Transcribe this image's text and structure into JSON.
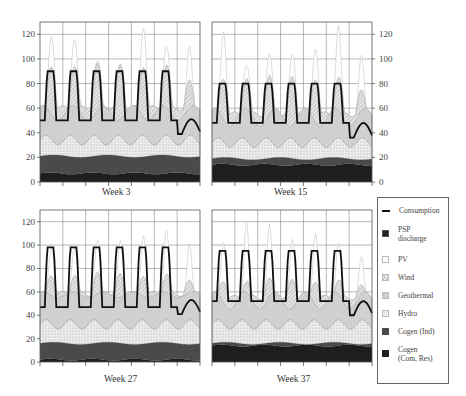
{
  "chart_data": [
    {
      "type": "area",
      "title": "Week 3",
      "xlabel": "Week 3",
      "ylabel": "",
      "ylim": [
        0,
        130
      ],
      "yticks": [
        0,
        20,
        40,
        60,
        80,
        100,
        120
      ],
      "y_axis_side": "left",
      "x_ticks_count": 8,
      "grid": true,
      "series": [
        {
          "name": "Cogen (Com, Res)",
          "approx_level": 7
        },
        {
          "name": "Cogen (Ind)",
          "approx_level": 21
        },
        {
          "name": "Hydro",
          "approx_range": [
            30,
            38
          ]
        },
        {
          "name": "Geothermal",
          "approx_range": [
            50,
            62
          ]
        },
        {
          "name": "Wind",
          "approx_range": [
            60,
            95
          ]
        },
        {
          "name": "PV",
          "approx_peaks": [
            118,
            116,
            98,
            92,
            125,
            110
          ]
        },
        {
          "name": "Consumption",
          "daily_peak": 90,
          "night_min": 50,
          "weekend_min": 39
        }
      ]
    },
    {
      "type": "area",
      "title": "Week 15",
      "xlabel": "Week 15",
      "ylim": [
        0,
        130
      ],
      "yticks": [
        0,
        20,
        40,
        60,
        80,
        100,
        120
      ],
      "y_axis_side": "right",
      "x_ticks_count": 8,
      "grid": true,
      "series": [
        {
          "name": "Cogen (Com, Res)",
          "approx_level": 14
        },
        {
          "name": "Cogen (Ind)",
          "approx_level": 19
        },
        {
          "name": "Hydro",
          "approx_range": [
            28,
            36
          ]
        },
        {
          "name": "Geothermal",
          "approx_range": [
            45,
            60
          ]
        },
        {
          "name": "Wind",
          "approx_range": [
            55,
            85
          ]
        },
        {
          "name": "PV",
          "approx_peaks": [
            122,
            95,
            104,
            104,
            108,
            127,
            103
          ]
        },
        {
          "name": "Consumption",
          "daily_peak": 80,
          "night_min": 48,
          "weekend_min": 36
        }
      ]
    },
    {
      "type": "area",
      "title": "Week 27",
      "xlabel": "Week 27",
      "ylim": [
        0,
        130
      ],
      "yticks": [
        0,
        20,
        40,
        60,
        80,
        100,
        120
      ],
      "y_axis_side": "left",
      "x_ticks_count": 8,
      "grid": true,
      "series": [
        {
          "name": "Cogen (Com, Res)",
          "approx_level": 2
        },
        {
          "name": "Cogen (Ind)",
          "approx_level": 16
        },
        {
          "name": "Hydro",
          "approx_range": [
            28,
            36
          ]
        },
        {
          "name": "Geothermal",
          "approx_range": [
            55,
            60
          ]
        },
        {
          "name": "Wind",
          "approx_range": [
            58,
            75
          ]
        },
        {
          "name": "PV",
          "approx_peaks": [
            98,
            98,
            104,
            104,
            108,
            113,
            101
          ]
        },
        {
          "name": "Consumption",
          "daily_peak": 98,
          "night_min": 47,
          "weekend_min": 41
        }
      ]
    },
    {
      "type": "area",
      "title": "Week 37",
      "xlabel": "Week 37",
      "ylim": [
        0,
        130
      ],
      "yticks": [
        0,
        20,
        40,
        60,
        80,
        100,
        120
      ],
      "y_axis_side": "none",
      "x_ticks_count": 8,
      "grid": true,
      "series": [
        {
          "name": "Cogen (Com, Res)",
          "approx_level": 14
        },
        {
          "name": "Cogen (Ind)",
          "approx_level": 16
        },
        {
          "name": "Hydro",
          "approx_range": [
            28,
            36
          ]
        },
        {
          "name": "Geothermal",
          "approx_range": [
            45,
            60
          ]
        },
        {
          "name": "Wind",
          "approx_range": [
            55,
            70
          ]
        },
        {
          "name": "PV",
          "approx_peaks": [
            102,
            120,
            118,
            105,
            110,
            102,
            90
          ]
        },
        {
          "name": "Consumption",
          "daily_peak": 95,
          "night_min": 52,
          "weekend_min": 40
        }
      ]
    }
  ],
  "panels": {
    "tl": {
      "label": "Week 3"
    },
    "tr": {
      "label": "Week 15"
    },
    "bl": {
      "label": "Week 27"
    },
    "br": {
      "label": "Week 37"
    }
  },
  "yticks": [
    "0",
    "20",
    "40",
    "60",
    "80",
    "100",
    "120"
  ],
  "legend": {
    "items": [
      {
        "label": "Consumption"
      },
      {
        "label": "PSP discharge"
      },
      {
        "label": "PV"
      },
      {
        "label": "Wind"
      },
      {
        "label": "Geothermal"
      },
      {
        "label": "Hydro"
      },
      {
        "label": "Cogen (Ind)"
      },
      {
        "label": "Cogen (Com, Res)"
      }
    ]
  },
  "colors": {
    "consumption": "#111111",
    "psp": "#333333",
    "pv": "#ffffff",
    "wind": "#d6d6d6",
    "geothermal": "#cfcfcf",
    "hydro": "#e2e2e2",
    "cogen_ind": "#4a4a4a",
    "cogen_com": "#1e1e1e"
  }
}
